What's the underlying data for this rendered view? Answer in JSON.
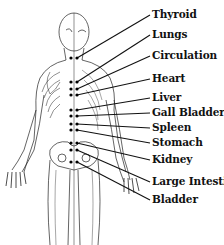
{
  "diagram": {
    "line_color": "#111111",
    "dot_color": "#000000",
    "labels": [
      {
        "text": "Thyroid"
      },
      {
        "text": "Lungs"
      },
      {
        "text": "Circulation"
      },
      {
        "text": "Heart"
      },
      {
        "text": "Liver"
      },
      {
        "text": "Gall Bladder"
      },
      {
        "text": "Spleen"
      },
      {
        "text": "Stomach"
      },
      {
        "text": "Kidney"
      },
      {
        "text": "Large Intestine"
      },
      {
        "text": "Bladder"
      }
    ]
  }
}
